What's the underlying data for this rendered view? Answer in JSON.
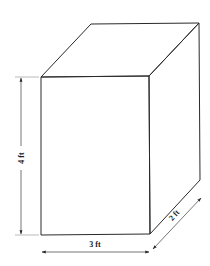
{
  "diagram": {
    "type": "rectangular-prism",
    "dimensions": {
      "height": {
        "label": "4 ft",
        "value": 4,
        "unit": "ft"
      },
      "width": {
        "label": "3 ft",
        "value": 3,
        "unit": "ft"
      },
      "depth": {
        "label": "2 ft",
        "value": 2,
        "unit": "ft"
      }
    },
    "colors": {
      "background": "#ffffff",
      "lines": "#2a2a2a"
    }
  }
}
